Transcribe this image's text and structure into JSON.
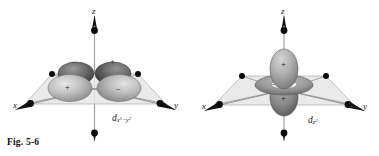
{
  "figure": {
    "caption": "Fig. 5-6",
    "background_color": "#ffffff",
    "ink_color": "#161616"
  },
  "panels": [
    {
      "id": "d-x2-y2",
      "orbital_label_main": "d",
      "orbital_label_sub": "x",
      "orbital_label_sub_exp1": "2",
      "orbital_label_sub_mid": "−y",
      "orbital_label_sub_exp2": "2",
      "orbital_label_plain": "d x2−y2",
      "axes": [
        {
          "name": "x",
          "label": "x"
        },
        {
          "name": "y",
          "label": "y"
        },
        {
          "name": "z",
          "label": "z"
        }
      ],
      "lobes": [
        {
          "name": "front-left-lobe",
          "sign": "+",
          "shade": "#b9b9b9"
        },
        {
          "name": "front-right-lobe",
          "sign": "−",
          "shade": "#b2b2b2"
        },
        {
          "name": "back-left-lobe",
          "sign": "−",
          "shade": "#646464"
        },
        {
          "name": "back-right-lobe",
          "sign": "+",
          "shade": "#5d5d5d"
        }
      ],
      "ligand_count": 6,
      "plane_color": "#e2e2e2"
    },
    {
      "id": "d-z2",
      "orbital_label_main": "d",
      "orbital_label_sub": "z",
      "orbital_label_sub_exp1": "2",
      "orbital_label_sub_mid": "",
      "orbital_label_sub_exp2": "",
      "orbital_label_plain": "d z2",
      "axes": [
        {
          "name": "x",
          "label": "x"
        },
        {
          "name": "y",
          "label": "y"
        },
        {
          "name": "z",
          "label": "z"
        }
      ],
      "lobes": [
        {
          "name": "top-lobe",
          "sign": "+",
          "shade": "#adadad"
        },
        {
          "name": "bottom-lobe",
          "sign": "+",
          "shade": "#8e8e8e"
        },
        {
          "name": "torus",
          "sign": "−",
          "shade": "#9a9a9a"
        }
      ],
      "ligand_count": 6,
      "plane_color": "#e2e2e2"
    }
  ]
}
